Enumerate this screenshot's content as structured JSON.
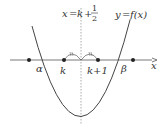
{
  "diagram": {
    "type": "parabola-axis-of-symmetry",
    "axis_label": "x",
    "curve_label_lhs": "y",
    "curve_label_eq": "=",
    "curve_label_rhs": "f(x)",
    "symmetry_label_lhs": "x",
    "symmetry_label_eq": "=",
    "symmetry_label_k": "k",
    "symmetry_label_plus": "+",
    "symmetry_label_num": "1",
    "symmetry_label_den": "2",
    "points": [
      {
        "name": "left-extra",
        "label": ""
      },
      {
        "name": "k",
        "label": "k"
      },
      {
        "name": "k+1",
        "label": "k+1"
      },
      {
        "name": "right-extra",
        "label": ""
      }
    ],
    "roots": {
      "alpha": "α",
      "beta": "β"
    },
    "label_k": "k",
    "label_k1": "k+1",
    "tick_mark": "=",
    "colors": {
      "line": "#444444",
      "dashed": "#888888",
      "text": "#333333"
    }
  }
}
